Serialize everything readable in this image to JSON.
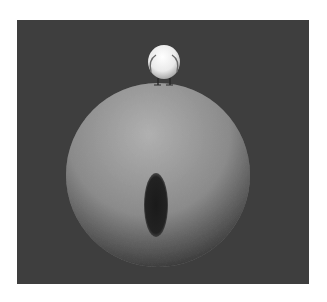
{
  "scene": {
    "description": "3D render of a small white bird-like character standing on top of a large textured sphere with a dark elliptical hole",
    "background_color": "#3e3e3e",
    "page_color": "#ffffff",
    "sphere_color_light": "#a8a8a8",
    "sphere_color_dark": "#2a2a2a",
    "hole_color": "#1e1e1e",
    "character_color": "#f2f2f2"
  }
}
